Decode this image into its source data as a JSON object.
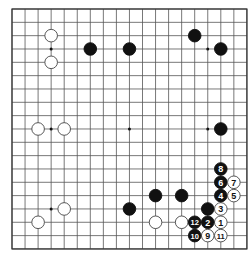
{
  "board": {
    "size": 19,
    "origin_x": 12,
    "origin_y": 9,
    "spacing_x": 13.05,
    "spacing_y": 13.33,
    "stone_radius": 6.3,
    "line_color": "#555555",
    "border_color": "#333333",
    "background": "#ffffff",
    "black_color": "#111111",
    "white_fill": "#ffffff",
    "white_stroke": "#444444",
    "hoshi": [
      [
        3,
        3
      ],
      [
        9,
        3
      ],
      [
        15,
        3
      ],
      [
        3,
        9
      ],
      [
        9,
        9
      ],
      [
        15,
        9
      ],
      [
        3,
        15
      ],
      [
        9,
        15
      ],
      [
        15,
        15
      ]
    ]
  },
  "stones": [
    {
      "color": "white",
      "col": 3,
      "row": 2,
      "label": ""
    },
    {
      "color": "white",
      "col": 3,
      "row": 4,
      "label": ""
    },
    {
      "color": "black",
      "col": 6,
      "row": 3,
      "label": ""
    },
    {
      "color": "black",
      "col": 9,
      "row": 3,
      "label": ""
    },
    {
      "color": "black",
      "col": 14,
      "row": 2,
      "label": ""
    },
    {
      "color": "black",
      "col": 16,
      "row": 3,
      "label": ""
    },
    {
      "color": "white",
      "col": 2,
      "row": 9,
      "label": ""
    },
    {
      "color": "white",
      "col": 4,
      "row": 9,
      "label": ""
    },
    {
      "color": "black",
      "col": 16,
      "row": 9,
      "label": ""
    },
    {
      "color": "white",
      "col": 4,
      "row": 15,
      "label": ""
    },
    {
      "color": "white",
      "col": 2,
      "row": 16,
      "label": ""
    },
    {
      "color": "black",
      "col": 11,
      "row": 14,
      "label": ""
    },
    {
      "color": "black",
      "col": 13,
      "row": 14,
      "label": ""
    },
    {
      "color": "black",
      "col": 9,
      "row": 15,
      "label": ""
    },
    {
      "color": "white",
      "col": 11,
      "row": 16,
      "label": ""
    },
    {
      "color": "white",
      "col": 13,
      "row": 16,
      "label": ""
    },
    {
      "color": "black",
      "col": 15,
      "row": 15,
      "label": ""
    },
    {
      "color": "white",
      "col": 16,
      "row": 16,
      "label": "1"
    },
    {
      "color": "black",
      "col": 15,
      "row": 16,
      "label": "2"
    },
    {
      "color": "white",
      "col": 16,
      "row": 15,
      "label": "3"
    },
    {
      "color": "black",
      "col": 16,
      "row": 14,
      "label": "4"
    },
    {
      "color": "white",
      "col": 17,
      "row": 14,
      "label": "5"
    },
    {
      "color": "black",
      "col": 16,
      "row": 13,
      "label": "6"
    },
    {
      "color": "white",
      "col": 17,
      "row": 13,
      "label": "7"
    },
    {
      "color": "black",
      "col": 16,
      "row": 12,
      "label": "8"
    },
    {
      "color": "white",
      "col": 15,
      "row": 17,
      "label": "9"
    },
    {
      "color": "black",
      "col": 14,
      "row": 17,
      "label": "10"
    },
    {
      "color": "white",
      "col": 16,
      "row": 17,
      "label": "11"
    },
    {
      "color": "black",
      "col": 14,
      "row": 16,
      "label": "12"
    }
  ]
}
